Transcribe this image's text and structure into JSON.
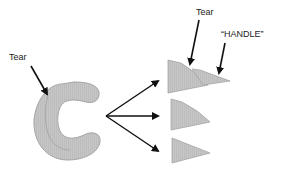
{
  "labels": {
    "tear_left": "Tear",
    "tear_top": "Tear",
    "handle": "“HANDLE”"
  },
  "colors": {
    "fill": "#c4c4c4",
    "stroke": "#9a9a9a",
    "arrow": "#111111",
    "background": "#ffffff"
  },
  "shapes": {
    "source": "c-shaped-piece",
    "pieces": [
      "triangle-top-with-handle",
      "handle-fragment",
      "triangle-middle",
      "triangle-bottom"
    ]
  }
}
